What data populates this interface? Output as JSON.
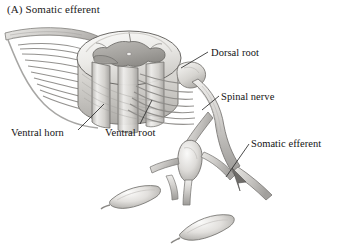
{
  "figure": {
    "panel_letter": "(A)",
    "panel_title": "(A)  Somatic efferent",
    "background_color": "#ffffff",
    "ink_color": "#131313",
    "rendering_style": "grayscale pencil/airbrush anatomical illustration"
  },
  "labels": {
    "dorsal_root": "Dorsal root",
    "spinal_nerve": "Spinal nerve",
    "somatic_efferent": "Somatic efferent",
    "ventral_horn": "Ventral horn",
    "ventral_root": "Ventral root"
  },
  "palette": {
    "outline": "#4a4a4a",
    "cord_light": "#f2f2f0",
    "cord_mid": "#d8d7d4",
    "cord_shadow": "#b0aeab",
    "gray_matter": "#a8a6a2",
    "nerve_light": "#e4e3e0",
    "nerve_mid": "#c2c0bd",
    "nerve_dark": "#8e8c89",
    "leader_line": "#2a2a2a"
  },
  "structures": [
    {
      "name": "spinal-cord-segment",
      "note": "cut cylinder of cord shown in oblique view"
    },
    {
      "name": "gray-matter-butterfly",
      "note": "H/butterfly shaped central gray matter on cut face"
    },
    {
      "name": "ventral-horn",
      "note": "anterior horn of gray matter, origin of motor neurons"
    },
    {
      "name": "dorsal-root-rootlets",
      "note": "fan of dorsal rootlets entering cord"
    },
    {
      "name": "ventral-root-rootlets",
      "note": "fan of ventral rootlets leaving cord"
    },
    {
      "name": "dorsal-root-ganglion",
      "note": "swelling on dorsal root"
    },
    {
      "name": "spinal-nerve-trunk",
      "note": "mixed nerve formed by root union"
    },
    {
      "name": "sympathetic-ganglion",
      "note": "paravertebral ganglion below spinal nerve"
    },
    {
      "name": "muscle-fiber-1",
      "note": "spindle shaped skeletal muscle fiber, left"
    },
    {
      "name": "muscle-fiber-2",
      "note": "spindle shaped skeletal muscle fiber, centre-bottom"
    },
    {
      "name": "efferent-arrow",
      "note": "arrowhead indicating direction of efferent conduction"
    }
  ],
  "leader_lines": [
    {
      "name": "dorsal-root-leader",
      "from": [
        208,
        52
      ],
      "to": [
        181,
        68
      ]
    },
    {
      "name": "spinal-nerve-leader",
      "from": [
        219,
        96
      ],
      "to": [
        202,
        110
      ]
    },
    {
      "name": "somatic-efferent-leader",
      "from": [
        249,
        144
      ],
      "to": [
        226,
        176
      ]
    },
    {
      "name": "ventral-horn-leader",
      "from": [
        77,
        131
      ],
      "to": [
        104,
        105
      ]
    },
    {
      "name": "ventral-root-leader",
      "from": [
        139,
        124
      ],
      "to": [
        152,
        101
      ]
    }
  ]
}
